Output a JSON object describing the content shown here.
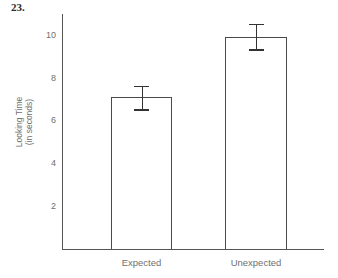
{
  "figure": {
    "number_label": "23."
  },
  "chart_data": {
    "type": "bar",
    "title": "",
    "xlabel": "",
    "ylabel": "Looking Time (in seconds)",
    "ylabel_line1": "Looking Time",
    "ylabel_line2": "(in seconds)",
    "categories": [
      "Expected",
      "Unexpected"
    ],
    "values": [
      7.1,
      9.95
    ],
    "errors": [
      0.55,
      0.6
    ],
    "error_low": [
      6.55,
      9.35
    ],
    "error_high": [
      7.65,
      10.55
    ],
    "ylim": [
      0,
      11.6
    ],
    "yticks": [
      2,
      4,
      6,
      8,
      10
    ],
    "ytick_labels": [
      "2",
      "4",
      "6",
      "8",
      "10"
    ],
    "grid": false,
    "legend": false,
    "bar_fill_color": "#ffffff",
    "bar_edge_color": "#4a4a4a",
    "error_color": "#333333",
    "axis_color": "#555555",
    "text_color": "#6f6f6f"
  }
}
